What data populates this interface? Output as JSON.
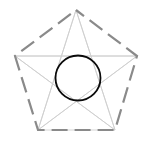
{
  "figure": {
    "canvas": {
      "width": 151,
      "height": 143,
      "background": "#ffffff"
    },
    "colors": {
      "pentagon_stroke": "#8a8a8a",
      "star_stroke": "#cfcfcf",
      "circle_stroke": "#000000",
      "background": "#ffffff"
    },
    "pentagon": {
      "name": "pentagon-outline",
      "stroke": "#8a8a8a",
      "stroke_width": 2.2,
      "dash_pattern": "16 7",
      "dash_offset": 6,
      "linecap": "butt",
      "vertices": [
        {
          "label": "top",
          "x": 76,
          "y": 10
        },
        {
          "label": "right",
          "x": 137,
          "y": 56
        },
        {
          "label": "bottom-right",
          "x": 115,
          "y": 130
        },
        {
          "label": "bottom-left",
          "x": 38,
          "y": 130
        },
        {
          "label": "left",
          "x": 15,
          "y": 56
        }
      ]
    },
    "star": {
      "name": "pentagram-star",
      "stroke": "#cfcfcf",
      "stroke_width": 0.9,
      "points": "76,10 115,130 15,56 137,56 38,130 76,10",
      "spokes": [
        {
          "from": "top",
          "x1": 76,
          "y1": 10,
          "x2": 38,
          "y2": 130
        },
        {
          "from": "top",
          "x1": 76,
          "y1": 10,
          "x2": 115,
          "y2": 130
        },
        {
          "from": "left",
          "x1": 15,
          "y1": 56,
          "x2": 137,
          "y2": 56
        },
        {
          "from": "left",
          "x1": 15,
          "y1": 56,
          "x2": 115,
          "y2": 130
        },
        {
          "from": "right",
          "x1": 137,
          "y1": 56,
          "x2": 38,
          "y2": 130
        },
        {
          "from": "bottom-left",
          "x1": 38,
          "y1": 130,
          "x2": 115,
          "y2": 130
        }
      ]
    },
    "circle": {
      "name": "center-circle",
      "cx": 78,
      "cy": 78,
      "r": 22.5,
      "stroke": "#0a0a0a",
      "stroke_width": 1.8
    }
  }
}
